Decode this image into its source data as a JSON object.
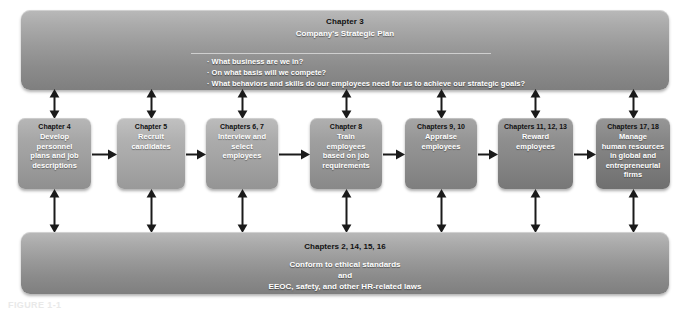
{
  "figure": {
    "caption_partial": "FIGURE 1-1"
  },
  "top_bar": {
    "chapter_label": "Chapter 3",
    "title": "Company's Strategic Plan",
    "questions": [
      "What business are we in?",
      "On what basis will we compete?",
      "What behaviors and skills do our employees need for us to achieve our strategic goals?"
    ]
  },
  "process": {
    "boxes": [
      {
        "chapter": "Chapter 4",
        "body": "Develop\npersonnel\nplans and job\ndescriptions",
        "color": "#9d9d9d"
      },
      {
        "chapter": "Chapter 5",
        "body": "Recruit\ncandidates",
        "color": "#a7a7a7"
      },
      {
        "chapter": "Chapters 6, 7",
        "body": "Interview and\nselect\nemployees",
        "color": "#a2a2a2"
      },
      {
        "chapter": "Chapter 8",
        "body": "Train\nemployees\nbased on job\nrequirements",
        "color": "#969696"
      },
      {
        "chapter": "Chapters 9, 10",
        "body": "Appraise\nemployees",
        "color": "#8c8c8c"
      },
      {
        "chapter": "Chapters 11, 12, 13",
        "body": "Reward\nemployees",
        "color": "#858585"
      },
      {
        "chapter": "Chapters 17, 18",
        "body": "Manage\nhuman resources\nin global and\nentrepreneurial\nfirms",
        "color": "#7d7d7d"
      }
    ]
  },
  "bottom_bar": {
    "chapter_label": "Chapters 2, 14, 15, 16",
    "lines": [
      "Conform to ethical standards",
      "and",
      "EEOC, safety, and other HR-related laws"
    ]
  },
  "colors": {
    "bar_light": "#b9b9b9",
    "bar_dark": "#7f7f7f",
    "arrow": "#1a1a1a",
    "chapter_text": "#111111",
    "body_text": "#ffffff",
    "page_background": "#ffffff"
  },
  "arrows": {
    "horizontal_count": 6,
    "vertical_top_count": 7,
    "vertical_bottom_count": 7,
    "style": "double-headed vertical, single-headed horizontal"
  }
}
